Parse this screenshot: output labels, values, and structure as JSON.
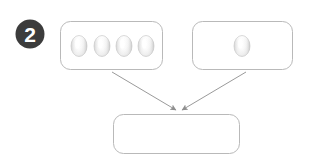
{
  "canvas": {
    "width": 313,
    "height": 164,
    "background_color": "#ffffff"
  },
  "step_badge": {
    "label": "2",
    "shape": "filled-circle",
    "fill_color": "#3c3c3c",
    "text_color": "#ffffff",
    "cx": 30,
    "cy": 34,
    "r": 14.5
  },
  "style": {
    "box_border_color": "#b9b9b9",
    "box_fill_color": "#ffffff",
    "box_border_width": 1,
    "box_corner_radius": 10,
    "arrow_color": "#9a9a9a",
    "arrow_width": 1,
    "egg_outline_color": "#c9c9c9",
    "egg_light_color": "#ffffff",
    "egg_shadow_color": "#c4c4c4"
  },
  "boxes": [
    {
      "id": "box-eggs-four",
      "name": "four-eggs-group-box",
      "label": "",
      "x": 60,
      "y": 21,
      "width": 103,
      "height": 49,
      "egg_count": 4,
      "eggs": [
        {
          "cx": 79,
          "cy": 46,
          "rx": 8,
          "ry": 10.5
        },
        {
          "cx": 102,
          "cy": 46,
          "rx": 8,
          "ry": 10.5
        },
        {
          "cx": 124,
          "cy": 46,
          "rx": 8,
          "ry": 10.5
        },
        {
          "cx": 146,
          "cy": 46,
          "rx": 8,
          "ry": 10.5
        }
      ]
    },
    {
      "id": "box-eggs-one",
      "name": "one-egg-group-box",
      "label": "",
      "x": 192,
      "y": 21,
      "width": 101,
      "height": 49,
      "egg_count": 1,
      "eggs": [
        {
          "cx": 242,
          "cy": 46,
          "rx": 8,
          "ry": 10.5
        }
      ]
    },
    {
      "id": "box-result",
      "name": "result-box",
      "label": "",
      "x": 113,
      "y": 114,
      "width": 127,
      "height": 40,
      "egg_count": 0,
      "eggs": []
    }
  ],
  "arrows": [
    {
      "id": "arrow-left",
      "name": "arrow-from-four-eggs-to-result",
      "from_box": "box-eggs-four",
      "to_box": "box-result",
      "x1": 112,
      "y1": 72,
      "x2": 176,
      "y2": 110
    },
    {
      "id": "arrow-right",
      "name": "arrow-from-one-egg-to-result",
      "from_box": "box-eggs-one",
      "to_box": "box-result",
      "x1": 246,
      "y1": 72,
      "x2": 182,
      "y2": 110
    }
  ]
}
